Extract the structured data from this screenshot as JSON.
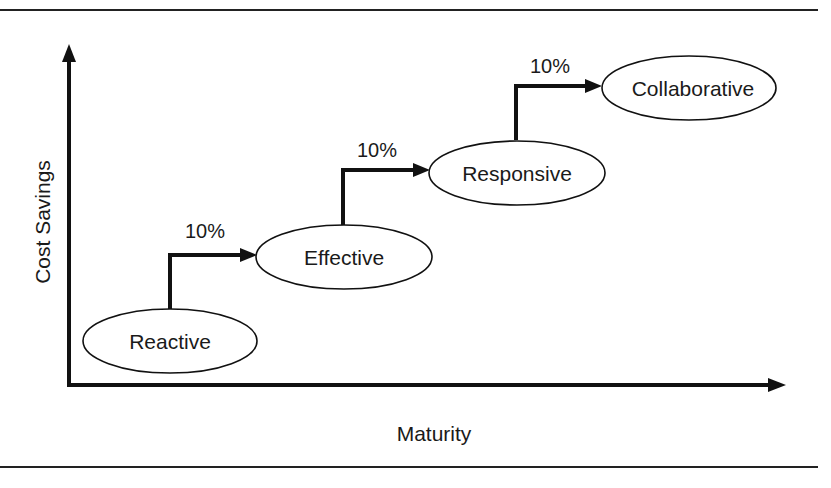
{
  "diagram": {
    "type": "maturity-staircase",
    "axes": {
      "y_label": "Cost Savings",
      "x_label": "Maturity"
    },
    "stages": [
      {
        "label": "Reactive",
        "cx": 170,
        "cy": 341
      },
      {
        "label": "Effective",
        "cx": 344,
        "cy": 257
      },
      {
        "label": "Responsive",
        "cx": 517,
        "cy": 173
      },
      {
        "label": "Collaborative",
        "cx": 689,
        "cy": 88
      }
    ],
    "steps": [
      {
        "from": "Reactive",
        "to": "Effective",
        "label": "10%"
      },
      {
        "from": "Effective",
        "to": "Responsive",
        "label": "10%"
      },
      {
        "from": "Responsive",
        "to": "Collaborative",
        "label": "10%"
      }
    ],
    "colors": {
      "stroke": "#111111",
      "text": "#1a1a1a",
      "background": "#ffffff"
    }
  }
}
